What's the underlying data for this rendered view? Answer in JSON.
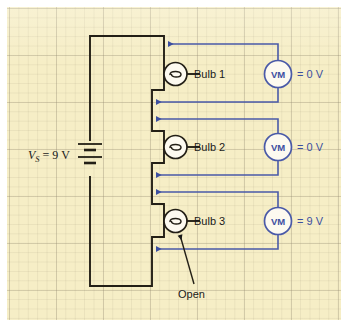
{
  "figure": {
    "kind": "circuit-diagram",
    "background_color": "#f6eec6",
    "grid_color": "#968c73",
    "wire_color": "#231f16",
    "meter_color": "#3c4fa0"
  },
  "source": {
    "name": "voltage-source",
    "symbol": "battery",
    "label_var": "V",
    "label_sub": "S",
    "label_rest": "= 9 V",
    "full_label": "V_S = 9 V",
    "value": "9 V"
  },
  "branches": [
    {
      "bulb_label": "Bulb 1",
      "bulb_symbol": "lamp",
      "meter_label": "VM",
      "meter_name": "voltmeter",
      "reading": "= 0 V",
      "reading_value": "0 V",
      "state": "lit"
    },
    {
      "bulb_label": "Bulb 2",
      "bulb_symbol": "lamp",
      "meter_label": "VM",
      "meter_name": "voltmeter",
      "reading": "= 0 V",
      "reading_value": "0 V",
      "state": "lit"
    },
    {
      "bulb_label": "Bulb 3",
      "bulb_symbol": "lamp",
      "meter_label": "VM",
      "meter_name": "voltmeter",
      "reading": "= 9 V",
      "reading_value": "9 V",
      "state": "open"
    }
  ],
  "annotations": [
    {
      "text": "Open",
      "points_to": "Bulb 3",
      "type": "callout"
    }
  ]
}
